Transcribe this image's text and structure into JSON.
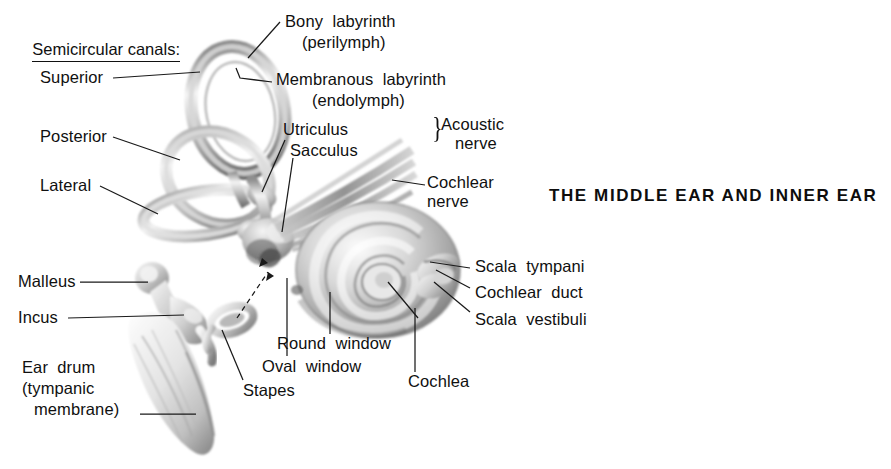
{
  "figure": {
    "title": "THE MIDDLE EAR AND INNER EAR",
    "heading": "Semicircular canals:",
    "brace_glyph": "}"
  },
  "labels": {
    "superior": "Superior",
    "posterior": "Posterior",
    "lateral": "Lateral",
    "bony_labyrinth": "Bony  labyrinth",
    "perilymph": "(perilymph)",
    "membranous_labyrinth": "Membranous  labyrinth",
    "endolymph": "(endolymph)",
    "utriculus": "Utriculus",
    "sacculus": "Sacculus",
    "acoustic_nerve_1": "Acoustic",
    "acoustic_nerve_2": "nerve",
    "cochlear_nerve_1": "Cochlear",
    "cochlear_nerve_2": "nerve",
    "scala_tympani": "Scala  tympani",
    "cochlear_duct": "Cochlear  duct",
    "scala_vestibuli": "Scala  vestibuli",
    "malleus": "Malleus",
    "incus": "Incus",
    "ear_drum_1": "Ear  drum",
    "ear_drum_2": "(tympanic",
    "ear_drum_3": "membrane)",
    "stapes": "Stapes",
    "oval_window": "Oval  window",
    "round_window": "Round  window",
    "cochlea": "Cochlea"
  },
  "colors": {
    "background": "#ffffff",
    "ink": "#101010",
    "leader": "#1a1a1a",
    "art_light": "#f2f2f2",
    "art_mid": "#b9b9b9",
    "art_dark": "#6a6a6a",
    "art_shadow": "#3a3a3a"
  }
}
